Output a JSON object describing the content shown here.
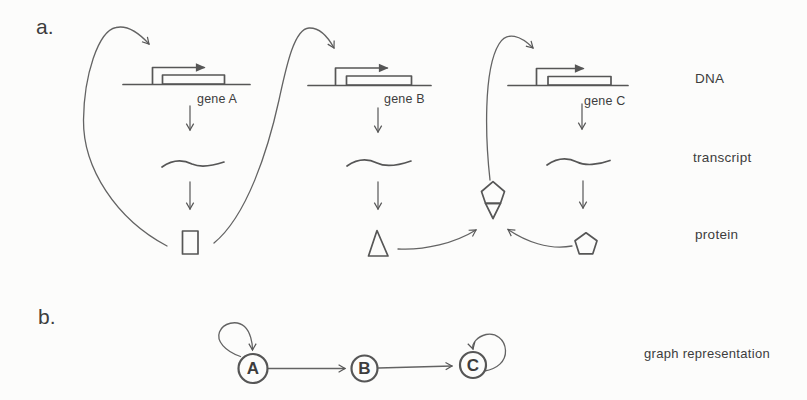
{
  "figure": {
    "colors": {
      "ink": "#565656",
      "text": "#3d3d3d",
      "background": "#fcfcfb"
    },
    "panel_a": {
      "label": "a.",
      "row_labels": {
        "dna": "DNA",
        "transcript": "transcript",
        "protein": "protein"
      },
      "genes": [
        {
          "name": "gene A",
          "protein_shape": "rectangle"
        },
        {
          "name": "gene B",
          "protein_shape": "triangle"
        },
        {
          "name": "gene C",
          "protein_shape": "pentagon"
        }
      ],
      "interactions": [
        "protein A → gene A",
        "protein A → gene B",
        "protein B + protein C complex → gene C"
      ]
    },
    "panel_b": {
      "label": "b.",
      "caption": "graph representation",
      "nodes": [
        {
          "id": "A"
        },
        {
          "id": "B"
        },
        {
          "id": "C"
        }
      ],
      "edges": [
        {
          "from": "A",
          "to": "A"
        },
        {
          "from": "A",
          "to": "B"
        },
        {
          "from": "B",
          "to": "C"
        },
        {
          "from": "C",
          "to": "C"
        }
      ]
    }
  }
}
